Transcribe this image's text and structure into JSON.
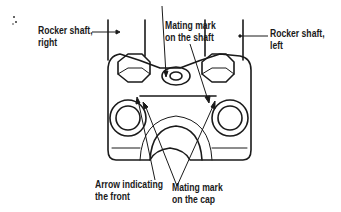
{
  "diagram": {
    "labels": {
      "rocker_right": [
        "Rocker shaft,",
        "right"
      ],
      "rocker_left": [
        "Rocker shaft,",
        "left"
      ],
      "mating_shaft": [
        "Mating mark",
        "on the shaft"
      ],
      "arrow_front": [
        "Arrow indicating",
        "the front"
      ],
      "mating_cap": [
        "Mating mark",
        "on the cap"
      ]
    }
  }
}
